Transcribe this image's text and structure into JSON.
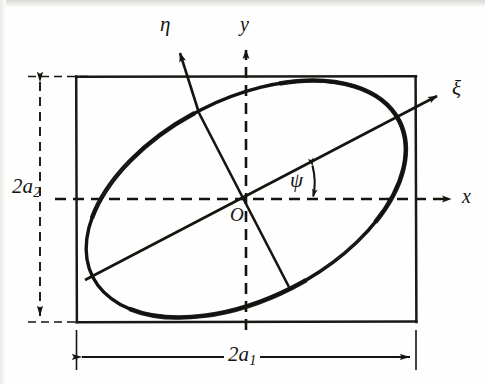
{
  "figure": {
    "kind": "geometry-diagram",
    "background_color": "#fefefe",
    "ink_color": "#16140f"
  },
  "labels": {
    "eta_axis": "η",
    "y_axis": "y",
    "xi_axis": "ξ",
    "x_axis": "x",
    "psi_angle": "ψ",
    "origin": "O",
    "width_dimension": "2a",
    "width_dimension_sub": "1",
    "height_dimension": "2a",
    "height_dimension_sub": "2"
  },
  "geometry": {
    "rect": {
      "x": 76,
      "y": 76,
      "width": 340,
      "height": 246
    },
    "center": {
      "x": 246,
      "y": 199
    },
    "ellipse": {
      "rx": 172,
      "ry": 100,
      "rotation_deg": -27
    },
    "psi_deg": 27,
    "axes": {
      "x_arrow_end": {
        "x": 455,
        "y": 199
      },
      "y_arrow_end": {
        "x": 246,
        "y": 44
      },
      "xi_arrow_end": {
        "x": 443,
        "y": 92
      },
      "eta_arrow_end": {
        "x": 176,
        "y": 47
      }
    },
    "dimension_lines": {
      "vertical": {
        "x": 40,
        "y_top": 76,
        "y_bottom": 322
      },
      "horizontal": {
        "y": 357,
        "x_left": 76,
        "x_right": 416
      }
    }
  },
  "colors": {
    "ink": "#16140f",
    "dash": "#1a1814",
    "paper": "#fefefe"
  }
}
